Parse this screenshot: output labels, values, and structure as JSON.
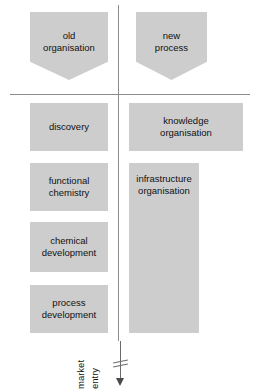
{
  "diagram": {
    "colors": {
      "node_fill": "#cdcdcd",
      "divider": "#8c8c8c",
      "text": "#111111",
      "axis": "#6b6b6b",
      "background": "#ffffff"
    },
    "columns": [
      {
        "id": "left",
        "banner": "old\norganisation",
        "nodes": [
          {
            "id": "discovery",
            "label": "discovery"
          },
          {
            "id": "functional-chemistry",
            "label": "functional\nchemistry"
          },
          {
            "id": "chemical-development",
            "label": "chemical\ndevelopment"
          },
          {
            "id": "process-development",
            "label": "process\ndevelopment"
          }
        ]
      },
      {
        "id": "right",
        "banner": "new\nprocess",
        "nodes": [
          {
            "id": "knowledge-organisation",
            "label": "knowledge\norganisation"
          },
          {
            "id": "infrastructure-organisation",
            "label": "infrastructure\norganisation"
          }
        ]
      }
    ],
    "axis": {
      "word_top": "market",
      "word_bottom": "entry",
      "direction": "down"
    }
  }
}
